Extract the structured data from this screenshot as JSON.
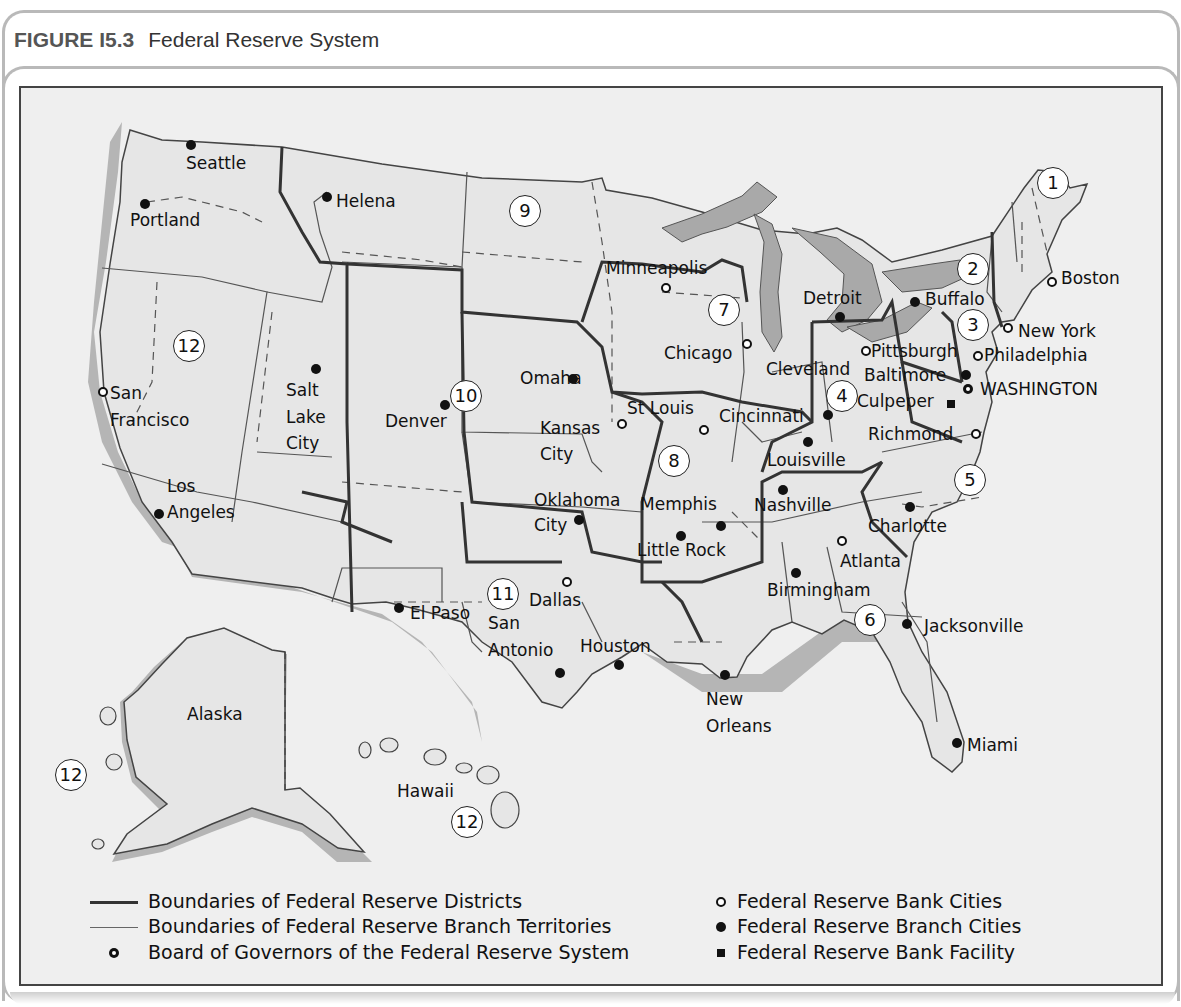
{
  "figure": {
    "number": "FIGURE I5.3",
    "title": "Federal Reserve System"
  },
  "map": {
    "colors": {
      "land": "#e9e9e9",
      "water_lakes": "#a9a9a9",
      "coast_shadow": "#b5b5b5",
      "district_boundary": "#333333",
      "branch_boundary": "#555555"
    },
    "districts": [
      {
        "id": "d1",
        "label": "1"
      },
      {
        "id": "d2",
        "label": "2"
      },
      {
        "id": "d3",
        "label": "3"
      },
      {
        "id": "d4",
        "label": "4"
      },
      {
        "id": "d5",
        "label": "5"
      },
      {
        "id": "d6",
        "label": "6"
      },
      {
        "id": "d7",
        "label": "7"
      },
      {
        "id": "d8",
        "label": "8"
      },
      {
        "id": "d9",
        "label": "9"
      },
      {
        "id": "d10",
        "label": "10"
      },
      {
        "id": "d11",
        "label": "11"
      },
      {
        "id": "d12a",
        "label": "12"
      },
      {
        "id": "d12b",
        "label": "12"
      },
      {
        "id": "d12c",
        "label": "12"
      }
    ],
    "cities": [
      {
        "name": "Boston",
        "type": "bank"
      },
      {
        "name": "New York",
        "type": "bank"
      },
      {
        "name": "Philadelphia",
        "type": "bank"
      },
      {
        "name": "Pittsburgh",
        "type": "bank"
      },
      {
        "name": "Cleveland",
        "type": "label"
      },
      {
        "name": "Richmond",
        "type": "bank"
      },
      {
        "name": "Atlanta",
        "type": "bank"
      },
      {
        "name": "Chicago",
        "type": "bank"
      },
      {
        "name": "St Louis",
        "type": "bank"
      },
      {
        "name": "Minneapolis",
        "type": "bank"
      },
      {
        "name": "Kansas City",
        "type": "bank"
      },
      {
        "name": "Dallas",
        "type": "bank"
      },
      {
        "name": "San Francisco",
        "type": "bank"
      },
      {
        "name": "WASHINGTON",
        "type": "board"
      },
      {
        "name": "Culpeper",
        "type": "facility"
      },
      {
        "name": "Buffalo",
        "type": "branch"
      },
      {
        "name": "Detroit",
        "type": "branch"
      },
      {
        "name": "Baltimore",
        "type": "branch"
      },
      {
        "name": "Cincinnati",
        "type": "branch"
      },
      {
        "name": "Louisville",
        "type": "branch"
      },
      {
        "name": "Nashville",
        "type": "branch"
      },
      {
        "name": "Charlotte",
        "type": "branch"
      },
      {
        "name": "Birmingham",
        "type": "branch"
      },
      {
        "name": "Jacksonville",
        "type": "branch"
      },
      {
        "name": "Miami",
        "type": "branch"
      },
      {
        "name": "New Orleans",
        "type": "branch"
      },
      {
        "name": "Memphis",
        "type": "branch"
      },
      {
        "name": "Little Rock",
        "type": "branch"
      },
      {
        "name": "Oklahoma City",
        "type": "branch"
      },
      {
        "name": "Omaha",
        "type": "branch"
      },
      {
        "name": "Denver",
        "type": "branch"
      },
      {
        "name": "Helena",
        "type": "branch"
      },
      {
        "name": "Salt Lake City",
        "type": "branch"
      },
      {
        "name": "Seattle",
        "type": "branch"
      },
      {
        "name": "Portland",
        "type": "branch"
      },
      {
        "name": "Los Angeles",
        "type": "branch"
      },
      {
        "name": "El Paso",
        "type": "branch"
      },
      {
        "name": "San Antonio",
        "type": "branch"
      },
      {
        "name": "Houston",
        "type": "branch"
      }
    ],
    "labels": {
      "boston": "Boston",
      "new_york": "New York",
      "philadelphia": "Philadelphia",
      "pittsburgh": "Pittsburgh",
      "cleveland": "Cleveland",
      "baltimore": "Baltimore",
      "washington": "WASHINGTON",
      "culpeper": "Culpeper",
      "richmond": "Richmond",
      "buffalo": "Buffalo",
      "detroit": "Detroit",
      "cincinnati": "Cincinnati",
      "louisville": "Louisville",
      "nashville": "Nashville",
      "charlotte": "Charlotte",
      "atlanta": "Atlanta",
      "birmingham": "Birmingham",
      "jacksonville": "Jacksonville",
      "miami": "Miami",
      "new": "New",
      "orleans": "Orleans",
      "memphis": "Memphis",
      "little_rock": "Little Rock",
      "oklahoma": "Oklahoma",
      "ok_city": "City",
      "dallas": "Dallas",
      "san": "San",
      "antonio": "Antonio",
      "houston": "Houston",
      "el_paso": "El Paso",
      "chicago": "Chicago",
      "minneapolis": "Minneapolis",
      "st_louis": "St Louis",
      "kansas": "Kansas",
      "kc_city": "City",
      "omaha": "Omaha",
      "denver": "Denver",
      "helena": "Helena",
      "salt": "Salt",
      "lake": "Lake",
      "slc_city": "City",
      "seattle": "Seattle",
      "portland": "Portland",
      "sf_san": "San",
      "francisco": "Francisco",
      "los": "Los",
      "angeles": "Angeles",
      "alaska": "Alaska",
      "hawaii": "Hawaii"
    }
  },
  "legend": {
    "district_boundaries": "Boundaries of Federal Reserve Districts",
    "branch_boundaries": "Boundaries of Federal Reserve Branch Territories",
    "board": "Board of Governors of the Federal Reserve System",
    "bank_cities": "Federal Reserve Bank Cities",
    "branch_cities": "Federal Reserve Branch Cities",
    "facility": "Federal Reserve Bank Facility"
  }
}
